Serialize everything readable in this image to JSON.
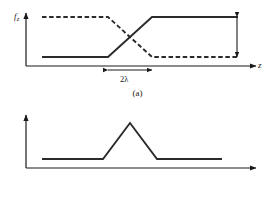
{
  "figure": {
    "background_color": "#ffffff",
    "ink_color": "#1a1a1a",
    "panels": [
      {
        "id": "a",
        "caption": "(a)",
        "ylabel_main": "f",
        "ylabel_sub": "z",
        "xlabel": "z",
        "annotation": "2λ",
        "annotation_name": "transition-width-2lambda"
      },
      {
        "id": "b",
        "caption": "(b)",
        "ylabel_main": "f",
        "ylabel_sub": "x",
        "xlabel": "z"
      }
    ]
  },
  "chart_data": [
    {
      "type": "line",
      "title": "(a)",
      "xlabel": "z",
      "ylabel": "f_z",
      "xlim": [
        0,
        275
      ],
      "ylim": [
        0,
        70
      ],
      "grid": false,
      "legend": "none",
      "annotations": [
        {
          "name": "transition-width-2lambda",
          "text": "2λ",
          "kind": "double-headed-horizontal-arrow",
          "x_start": 108,
          "x_end": 152,
          "y": 68
        },
        {
          "name": "amplitude-difference",
          "text": "",
          "kind": "double-headed-vertical-arrow",
          "x": 237,
          "y_start": 17,
          "y_end": 57
        }
      ],
      "series": [
        {
          "name": "f_z-rising",
          "style": "solid",
          "color": "#2b2b2b",
          "points": [
            [
              42,
              57
            ],
            [
              108,
              57
            ],
            [
              152,
              17
            ],
            [
              238,
              17
            ]
          ]
        },
        {
          "name": "f_z-falling",
          "style": "dashed",
          "color": "#2b2b2b",
          "points": [
            [
              42,
              17
            ],
            [
              108,
              17
            ],
            [
              152,
              57
            ],
            [
              238,
              57
            ]
          ]
        }
      ]
    },
    {
      "type": "line",
      "title": "(b)",
      "xlabel": "z",
      "ylabel": "f_x",
      "xlim": [
        0,
        275
      ],
      "ylim": [
        0,
        70
      ],
      "grid": false,
      "legend": "none",
      "annotations": [],
      "series": [
        {
          "name": "f_x-peak",
          "style": "solid",
          "color": "#2b2b2b",
          "points": [
            [
              42,
              58
            ],
            [
              103,
              58
            ],
            [
              130,
              22
            ],
            [
              157,
              58
            ],
            [
              222,
              58
            ]
          ]
        }
      ]
    }
  ]
}
